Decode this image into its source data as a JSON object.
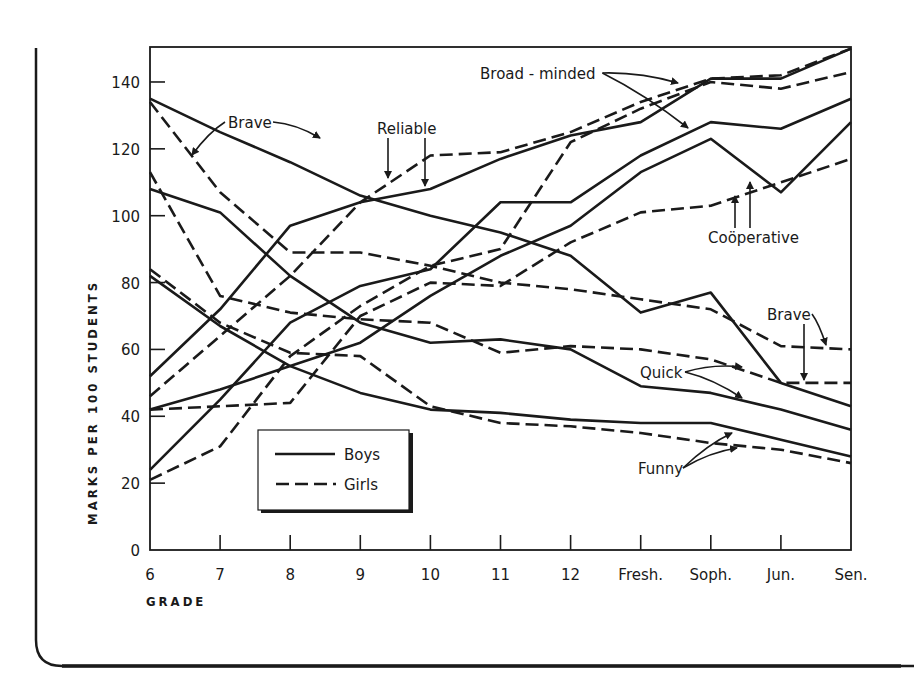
{
  "chart_data": {
    "type": "line",
    "title": "",
    "xlabel": "GRADE",
    "ylabel": "MARKS PER 100 STUDENTS",
    "categories": [
      "6",
      "7",
      "8",
      "9",
      "10",
      "11",
      "12",
      "Fresh.",
      "Soph.",
      "Jun.",
      "Sen."
    ],
    "ylim": [
      0,
      150
    ],
    "yticks": [
      0,
      20,
      40,
      60,
      80,
      100,
      120,
      140
    ],
    "grid": false,
    "legend": {
      "position": "lower-left inside plot",
      "entries": [
        {
          "label": "Boys",
          "style": "solid"
        },
        {
          "label": "Girls",
          "style": "dashed"
        }
      ]
    },
    "series": [
      {
        "name": "Brave (Boys)",
        "trait": "Brave",
        "group": "Boys",
        "style": "solid",
        "values": [
          135,
          125,
          116,
          106,
          100,
          95,
          88,
          71,
          77,
          50,
          43
        ]
      },
      {
        "name": "Brave (Girls)",
        "trait": "Brave",
        "group": "Girls",
        "style": "dashed",
        "values": [
          134,
          107,
          89,
          89,
          85,
          80,
          78,
          75,
          72,
          61,
          60
        ]
      },
      {
        "name": "Reliable (Boys)",
        "trait": "Reliable",
        "group": "Boys",
        "style": "solid",
        "values": [
          52,
          72,
          97,
          104,
          108,
          117,
          124,
          128,
          141,
          141,
          150
        ]
      },
      {
        "name": "Reliable (Girls)",
        "trait": "Reliable",
        "group": "Girls",
        "style": "dashed",
        "values": [
          46,
          64,
          82,
          104,
          118,
          119,
          125,
          134,
          141,
          142,
          150
        ]
      },
      {
        "name": "Broad-minded (Boys)",
        "trait": "Broad-minded",
        "group": "Boys",
        "style": "solid",
        "values": [
          24,
          45,
          68,
          79,
          84,
          104,
          104,
          118,
          128,
          126,
          135
        ]
      },
      {
        "name": "Broad-minded (Girls)",
        "trait": "Broad-minded",
        "group": "Girls",
        "style": "dashed",
        "values": [
          21,
          31,
          58,
          73,
          85,
          90,
          122,
          132,
          140,
          138,
          143
        ]
      },
      {
        "name": "Coöperative (Boys)",
        "trait": "Coöperative",
        "group": "Boys",
        "style": "solid",
        "values": [
          42,
          48,
          55,
          62,
          76,
          88,
          97,
          113,
          123,
          107,
          128
        ]
      },
      {
        "name": "Coöperative (Girls)",
        "trait": "Coöperative",
        "group": "Girls",
        "style": "dashed",
        "values": [
          42,
          43,
          44,
          70,
          80,
          79,
          92,
          101,
          103,
          110,
          117
        ]
      },
      {
        "name": "Quick (Boys)",
        "trait": "Quick",
        "group": "Boys",
        "style": "solid",
        "values": [
          108,
          101,
          82,
          68,
          62,
          63,
          60,
          49,
          47,
          42,
          36
        ]
      },
      {
        "name": "Quick (Girls)",
        "trait": "Quick",
        "group": "Girls",
        "style": "dashed",
        "values": [
          113,
          76,
          71,
          69,
          68,
          59,
          61,
          60,
          57,
          50,
          50
        ]
      },
      {
        "name": "Funny (Boys)",
        "trait": "Funny",
        "group": "Boys",
        "style": "solid",
        "values": [
          82,
          67,
          55,
          47,
          42,
          41,
          39,
          38,
          38,
          33,
          28
        ]
      },
      {
        "name": "Funny (Girls)",
        "trait": "Funny",
        "group": "Girls",
        "style": "dashed",
        "values": [
          84,
          68,
          59,
          58,
          43,
          38,
          37,
          35,
          32,
          30,
          26
        ]
      }
    ],
    "annotations": [
      {
        "text": "Brave",
        "x": 228,
        "y": 128,
        "arrows": [
          [
            192,
            155
          ],
          [
            320,
            138
          ]
        ]
      },
      {
        "text": "Reliable",
        "x": 377,
        "y": 134,
        "arrows": [
          [
            388,
            178
          ],
          [
            425,
            186
          ]
        ]
      },
      {
        "text": "Broad - minded",
        "x": 480,
        "y": 79,
        "arrows": [
          [
            678,
            83
          ],
          [
            688,
            128
          ]
        ]
      },
      {
        "text": "Coöperative",
        "x": 708,
        "y": 243,
        "arrows": [
          [
            750,
            182
          ],
          [
            735,
            196
          ]
        ]
      },
      {
        "text": "Brave",
        "x": 767,
        "y": 320,
        "arrows": [
          [
            826,
            345
          ],
          [
            804,
            380
          ]
        ]
      },
      {
        "text": "Quick",
        "x": 640,
        "y": 378,
        "arrows": [
          [
            742,
            367
          ],
          [
            742,
            398
          ]
        ]
      },
      {
        "text": "Funny",
        "x": 638,
        "y": 474,
        "arrows": [
          [
            732,
            433
          ],
          [
            737,
            448
          ]
        ]
      }
    ]
  },
  "axes": {
    "x_title": "GRADE",
    "y_title": "MARKS PER 100 STUDENTS"
  },
  "legend": {
    "boys_label": "Boys",
    "girls_label": "Girls"
  },
  "colors": {
    "ink": "#1a1a1a",
    "background": "#ffffff"
  }
}
